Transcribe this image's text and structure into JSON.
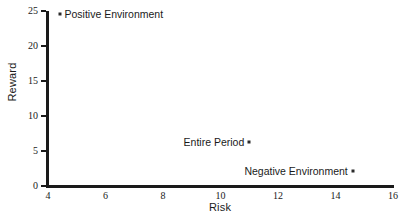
{
  "chart_data": {
    "type": "scatter",
    "title": "",
    "xlabel": "Risk",
    "ylabel": "Reward",
    "xlim": [
      4,
      16
    ],
    "ylim": [
      0,
      25
    ],
    "xticks": [
      4,
      6,
      8,
      10,
      12,
      14,
      16
    ],
    "yticks": [
      0,
      5,
      10,
      15,
      20,
      25
    ],
    "xtick_labels": [
      "4",
      "6",
      "8",
      "10",
      "12",
      "14",
      "16"
    ],
    "ytick_labels": [
      "0",
      "5",
      "10",
      "15",
      "20",
      "25"
    ],
    "grid": false,
    "legend": "none",
    "marker": "dot",
    "points": [
      {
        "label": "Positive Environment",
        "x": 4.4,
        "y": 24.6,
        "label_side": "right"
      },
      {
        "label": "Entire Period",
        "x": 11.0,
        "y": 6.3,
        "label_side": "left"
      },
      {
        "label": "Negative Environment",
        "x": 14.6,
        "y": 2.1,
        "label_side": "left"
      }
    ],
    "colors": {
      "axis": "#1a1a1a",
      "marker": "#2b2b2b",
      "background": "#ffffff",
      "text": "#1a1a1a"
    }
  }
}
